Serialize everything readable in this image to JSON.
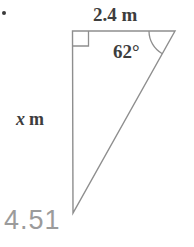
{
  "figure": {
    "labels": {
      "top": "2.4 m",
      "angle": "62°",
      "side_var": "x",
      "side_unit": "m",
      "bottom": "4.51"
    },
    "colors": {
      "line": "#8e8e8e",
      "label": "#3d3d3d",
      "bottom_text": "#9b9b9b"
    }
  }
}
